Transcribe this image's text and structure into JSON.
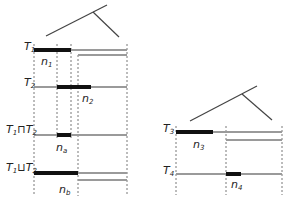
{
  "diagram": {
    "left": {
      "rows": [
        {
          "id": "T1",
          "label": "T",
          "sub": "1",
          "node_label": "n",
          "node_sub": "1"
        },
        {
          "id": "T2",
          "label": "T",
          "sub": "2",
          "node_label": "n",
          "node_sub": "2"
        },
        {
          "id": "meet",
          "label": "T",
          "sub": "1",
          "op": "⊓",
          "label2": "T",
          "sub2": "2",
          "node_label": "n",
          "node_sub": "a"
        },
        {
          "id": "join",
          "label": "T",
          "sub": "1",
          "op": "⊔",
          "label2": "T",
          "sub2": "2",
          "node_label": "n",
          "node_sub": "b"
        }
      ]
    },
    "right": {
      "rows": [
        {
          "id": "T3",
          "label": "T",
          "sub": "3",
          "node_label": "n",
          "node_sub": "3"
        },
        {
          "id": "T4",
          "label": "T",
          "sub": "4",
          "node_label": "n",
          "node_sub": "4"
        }
      ]
    },
    "colors": {
      "bar": "#111111",
      "track": "#9a9a9a",
      "tree": "#444444",
      "dashed": "#555555"
    }
  }
}
